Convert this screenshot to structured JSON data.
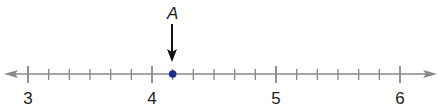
{
  "number_line": {
    "min": 3,
    "max": 6,
    "major_ticks": [
      "3",
      "4",
      "5",
      "6"
    ],
    "subdivisions_per_unit": 6,
    "arrows_both_ends": true,
    "line_color": "#888888"
  },
  "point": {
    "label": "A",
    "value": 4.1667,
    "value_fraction": "4 1/6",
    "color": "#1f2d8a",
    "arrow_color": "#111111"
  }
}
